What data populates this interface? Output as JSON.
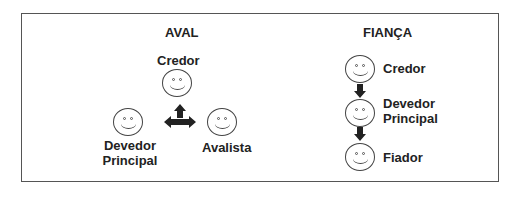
{
  "aval": {
    "title": "AVAL",
    "credor": "Credor",
    "devedor_line1": "Devedor",
    "devedor_line2": "Principal",
    "avalista": "Avalista"
  },
  "fianca": {
    "title": "FIANÇA",
    "credor": "Credor",
    "devedor_line1": "Devedor",
    "devedor_line2": "Principal",
    "fiador": "Fiador"
  }
}
